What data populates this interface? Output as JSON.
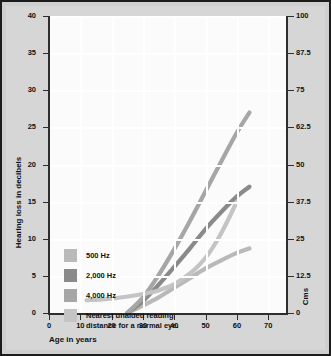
{
  "chart_data": {
    "type": "line",
    "title": "",
    "xlabel": "Age in years",
    "ylabel": "Hearing loss in decibels",
    "y2label": "Cms",
    "xlim": [
      0,
      76
    ],
    "ylim": [
      40,
      0
    ],
    "y2lim": [
      100,
      0
    ],
    "xticks": [
      0,
      10,
      20,
      30,
      40,
      50,
      60,
      70
    ],
    "yticks": [
      0,
      5,
      10,
      15,
      20,
      25,
      30,
      35,
      40
    ],
    "y2ticks": [
      0,
      12.5,
      25,
      37.5,
      50,
      62.5,
      75,
      87.5,
      100
    ],
    "grid": true,
    "legend_position": "lower-left",
    "y_inverted": true,
    "series": [
      {
        "name": "500 Hz",
        "color": "#b9b9b9",
        "axis": "left",
        "points": [
          [
            25,
            0
          ],
          [
            30,
            1.0
          ],
          [
            35,
            2.1
          ],
          [
            40,
            3.4
          ],
          [
            45,
            4.7
          ],
          [
            50,
            6.0
          ],
          [
            55,
            7.1
          ],
          [
            60,
            8.1
          ],
          [
            64,
            8.7
          ]
        ]
      },
      {
        "name": "2,000 Hz",
        "color": "#8a8a8a",
        "axis": "left",
        "points": [
          [
            25,
            0
          ],
          [
            30,
            1.6
          ],
          [
            35,
            3.8
          ],
          [
            40,
            6.2
          ],
          [
            45,
            8.7
          ],
          [
            50,
            11.3
          ],
          [
            55,
            13.6
          ],
          [
            60,
            15.7
          ],
          [
            64,
            17.0
          ]
        ]
      },
      {
        "name": "4,000 Hz",
        "color": "#a6a6a6",
        "axis": "left",
        "points": [
          [
            25,
            0
          ],
          [
            30,
            2.1
          ],
          [
            35,
            5.1
          ],
          [
            40,
            8.6
          ],
          [
            45,
            12.4
          ],
          [
            50,
            16.4
          ],
          [
            55,
            20.4
          ],
          [
            60,
            24.3
          ],
          [
            64,
            27.0
          ]
        ]
      },
      {
        "name": "Nearest unaided reading\ndistance for a normal eye.",
        "color": "#c4c4c4",
        "axis": "right",
        "points": [
          [
            12,
            4.3
          ],
          [
            18,
            4.7
          ],
          [
            24,
            5.4
          ],
          [
            30,
            6.4
          ],
          [
            35,
            7.6
          ],
          [
            40,
            9.7
          ],
          [
            45,
            13.3
          ],
          [
            48,
            16.2
          ],
          [
            51,
            20.0
          ],
          [
            54,
            25.0
          ],
          [
            57,
            31.0
          ],
          [
            60,
            37.5
          ]
        ]
      }
    ]
  },
  "legend": {
    "items": [
      {
        "label": "500 Hz",
        "color": "#b9b9b9"
      },
      {
        "label": "2,000 Hz",
        "color": "#8a8a8a"
      },
      {
        "label": "4,000 Hz",
        "color": "#a6a6a6"
      },
      {
        "label": "Nearest unaided reading\ndistance for a normal eye.",
        "color": "#c4c4c4"
      }
    ]
  }
}
